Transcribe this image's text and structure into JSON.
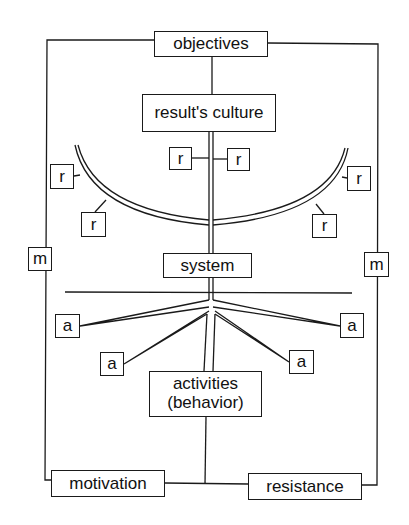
{
  "diagram": {
    "nodes": {
      "objectives": "objectives",
      "results_culture": "result's culture",
      "system": "system",
      "activities_line1": "activities",
      "activities_line2": "(behavior)",
      "motivation": "motivation",
      "resistance": "resistance"
    },
    "small_labels": {
      "r": "r",
      "m": "m",
      "a": "a"
    },
    "r_boxes": [
      "r",
      "r",
      "r",
      "r",
      "r",
      "r"
    ],
    "m_boxes": [
      "m",
      "m"
    ],
    "a_boxes": [
      "a",
      "a",
      "a",
      "a"
    ],
    "colors": {
      "line": "#1a1a1a",
      "background": "#ffffff"
    }
  }
}
